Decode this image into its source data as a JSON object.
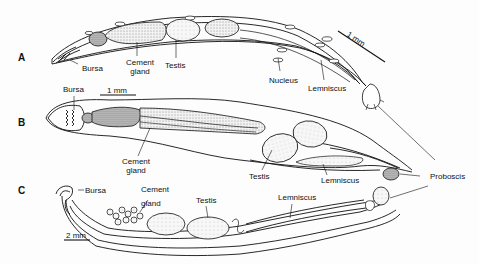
{
  "figure": {
    "panels": [
      {
        "id": "A",
        "label": "A",
        "scale_bar": "1 mm",
        "labels": {
          "bursa": "Bursa",
          "cement_gland": "Cement gland",
          "testis": "Testis",
          "nucleus": "Nucleus",
          "lemniscus": "Lemniscus"
        }
      },
      {
        "id": "B",
        "label": "B",
        "scale_bar": "1 mm",
        "labels": {
          "bursa": "Bursa",
          "cement_gland": "Cement gland",
          "testis": "Testis",
          "lemniscus": "Lemniscus"
        }
      },
      {
        "id": "C",
        "label": "C",
        "scale_bar": "2 mm",
        "labels": {
          "bursa": "Bursa",
          "cement_gland": "Cement gland",
          "testis": "Testis",
          "lemniscus": "Lemniscus"
        }
      }
    ],
    "shared_labels": {
      "proboscis": "Proboscis"
    },
    "colors": {
      "ink": "#111111",
      "paper": "#fdfdfd",
      "stipple": "#d8d8d8"
    }
  }
}
